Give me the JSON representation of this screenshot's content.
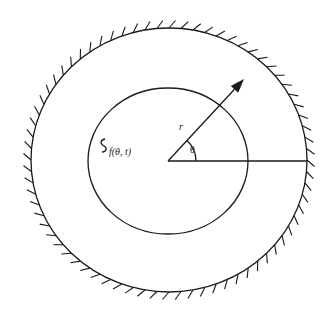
{
  "figure": {
    "width": 335,
    "height": 318,
    "stroke_color": "#1a1a1a",
    "background": "#ffffff"
  },
  "outer_boundary": {
    "cx": 169,
    "cy": 160,
    "rx": 138,
    "ry": 132,
    "hatched": true,
    "hatch_side": "outside",
    "hatch_count": 72
  },
  "inner_boundary": {
    "cx": 168,
    "cy": 161,
    "rx": 80,
    "ry": 73
  },
  "origin": {
    "x": 168,
    "y": 161
  },
  "radius_vector": {
    "tip_x": 244,
    "tip_y": 79,
    "label": "r"
  },
  "reference_line": {
    "end_x": 307,
    "end_y": 161
  },
  "angle": {
    "label": "θ",
    "arc_radius": 28
  },
  "interface_label": {
    "text": "f(θ, t)"
  }
}
